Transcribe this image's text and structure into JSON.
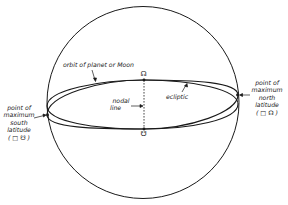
{
  "diagram": {
    "colors": {
      "line": "#1a1a1a",
      "background": "#ffffff"
    },
    "labels": {
      "orbit": "orbit of planet or Moon",
      "ecliptic": "ecliptic",
      "nodal_line_1": "nodal",
      "nodal_line_2": "line",
      "north_1": "point of",
      "north_2": "maximum",
      "north_3": "north",
      "north_4": "latitude",
      "north_5": "( □ ☊ )",
      "south_1": "point of",
      "south_2": "maximum",
      "south_3": "south",
      "south_4": "latitude",
      "south_5": "( □ ☋ )"
    },
    "symbols": {
      "ascending_node": "☊",
      "descending_node": "☋"
    },
    "elements": [
      "celestial-sphere",
      "orbit-ellipse",
      "ecliptic-ellipse",
      "nodal-line",
      "ascending-node",
      "descending-node",
      "max-north-latitude-point",
      "max-south-latitude-point"
    ]
  }
}
